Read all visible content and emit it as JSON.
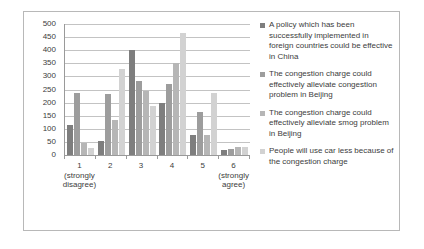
{
  "chart_data": {
    "type": "bar",
    "title": "",
    "xlabel": "",
    "ylabel": "",
    "ylim": [
      0,
      500
    ],
    "ytick_step": 50,
    "grid": true,
    "legend_position": "right",
    "categories": [
      "1",
      "2",
      "3",
      "4",
      "5",
      "6"
    ],
    "category_sublabels": [
      "(strongly\ndisagree)",
      "",
      "",
      "",
      "",
      "(strongly\nagree)"
    ],
    "yticks": [
      0,
      50,
      100,
      150,
      200,
      250,
      300,
      350,
      400,
      450,
      500
    ],
    "series": [
      {
        "name": "A policy which has been successfully implemented in foreign countries could be effective in China",
        "color": "#7e7e7e",
        "values": [
          115,
          55,
          400,
          200,
          78,
          20
        ]
      },
      {
        "name": "The congestion charge could effectively alleviate congestion problem in Beijing",
        "color": "#9d9d9d",
        "values": [
          235,
          233,
          283,
          272,
          163,
          22
        ]
      },
      {
        "name": "The congestion charge could effectively alleviate smog problem in Beijing",
        "color": "#b6b6b6",
        "values": [
          45,
          135,
          245,
          350,
          78,
          32
        ]
      },
      {
        "name": "People will use car less because of the congestion charge",
        "color": "#d2d2d2",
        "values": [
          25,
          330,
          188,
          465,
          237,
          30
        ]
      }
    ]
  },
  "legend": {
    "items": [
      {
        "label": "A policy which has been successfully implemented in foreign countries could be effective in China",
        "color": "#7e7e7e"
      },
      {
        "label": "The congestion charge could effectively alleviate congestion problem in Beijing",
        "color": "#9d9d9d"
      },
      {
        "label": "The congestion charge could effectively alleviate smog problem in Beijing",
        "color": "#b6b6b6"
      },
      {
        "label": "People will use car less because of the congestion charge",
        "color": "#d2d2d2"
      }
    ]
  },
  "axis": {
    "y_labels": [
      "500",
      "450",
      "400",
      "350",
      "300",
      "250",
      "200",
      "150",
      "100",
      "50",
      "0"
    ],
    "x_labels": [
      "1",
      "2",
      "3",
      "4",
      "5",
      "6"
    ],
    "x_sub_1": "(strongly disagree)",
    "x_sub_6": "(strongly agree)"
  }
}
